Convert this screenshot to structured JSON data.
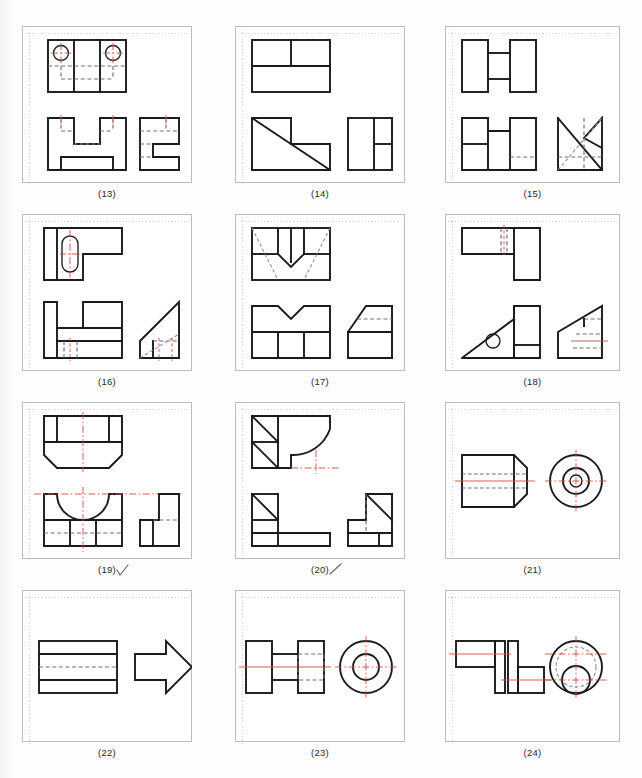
{
  "page": {
    "header_text": "",
    "footer_text": "",
    "background_color": "#fdfdfd",
    "width": 642,
    "height": 778
  },
  "style": {
    "visible_line_color": "#1b1b1b",
    "hidden_line_color": "#6e7078",
    "center_line_color": "#d4544a",
    "grid_color": "#969baf",
    "frame_color": "#b9bcc2",
    "caption_color": "#2a2a2a"
  },
  "layout": {
    "columns": 3,
    "rows": 4,
    "grid_square_px": 13
  },
  "panels": [
    {
      "id": "13",
      "caption": "(13)",
      "checked": false,
      "row": 0,
      "col": 0,
      "views": [
        "top",
        "front",
        "side"
      ],
      "features": [
        "two through holes",
        "notched block",
        "stepped profile"
      ]
    },
    {
      "id": "14",
      "caption": "(14)",
      "checked": false,
      "row": 0,
      "col": 1,
      "views": [
        "top",
        "front",
        "side"
      ],
      "features": [
        "diagonal chamfer",
        "L-step block"
      ]
    },
    {
      "id": "15",
      "caption": "(15)",
      "checked": false,
      "row": 0,
      "col": 2,
      "views": [
        "top",
        "front",
        "side"
      ],
      "features": [
        "H-shape plan",
        "vee notch side view"
      ]
    },
    {
      "id": "16",
      "caption": "(16)",
      "checked": false,
      "row": 1,
      "col": 0,
      "views": [
        "top",
        "front",
        "side"
      ],
      "features": [
        "obround slot",
        "inclined wedge"
      ]
    },
    {
      "id": "17",
      "caption": "(17)",
      "checked": false,
      "row": 1,
      "col": 1,
      "views": [
        "top",
        "front",
        "side"
      ],
      "features": [
        "vee groove",
        "M-shape front",
        "chamfered side"
      ]
    },
    {
      "id": "18",
      "caption": "(18)",
      "checked": false,
      "row": 1,
      "col": 2,
      "views": [
        "top",
        "front",
        "side"
      ],
      "features": [
        "inclined face",
        "through hole",
        "wedge block"
      ]
    },
    {
      "id": "19",
      "caption": "(19)",
      "checked": true,
      "row": 2,
      "col": 0,
      "views": [
        "top",
        "front",
        "side"
      ],
      "features": [
        "chamfered base",
        "semicircular cut",
        "stepped side"
      ]
    },
    {
      "id": "20",
      "caption": "(20)",
      "checked": true,
      "row": 2,
      "col": 1,
      "views": [
        "top",
        "front",
        "side"
      ],
      "features": [
        "fillet radius",
        "ribbed corner",
        "L-bracket"
      ]
    },
    {
      "id": "21",
      "caption": "(21)",
      "checked": false,
      "row": 2,
      "col": 2,
      "views": [
        "front",
        "end"
      ],
      "features": [
        "tapered cone end",
        "concentric bore",
        "circular end view"
      ]
    },
    {
      "id": "22",
      "caption": "(22)",
      "checked": false,
      "row": 3,
      "col": 0,
      "views": [
        "front",
        "top"
      ],
      "features": [
        "rectangular bar",
        "arrow plan shape"
      ]
    },
    {
      "id": "23",
      "caption": "(23)",
      "checked": false,
      "row": 3,
      "col": 1,
      "views": [
        "front",
        "end"
      ],
      "features": [
        "double flange shaft",
        "concentric circles",
        "hidden bore"
      ]
    },
    {
      "id": "24",
      "caption": "(24)",
      "checked": false,
      "row": 3,
      "col": 2,
      "views": [
        "front",
        "end"
      ],
      "features": [
        "stepped shaft",
        "offset boss",
        "two circles"
      ]
    }
  ]
}
